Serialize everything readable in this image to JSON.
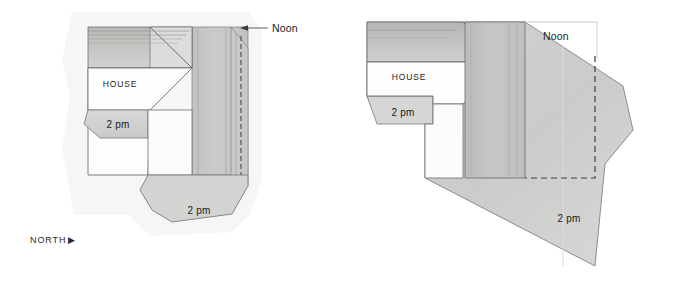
{
  "figure": {
    "type": "architectural-shadow-study",
    "panel_count": 2,
    "background_color": "#ffffff",
    "ink_color": "#555555"
  },
  "panels": [
    {
      "id": "left",
      "name": "shadow-plan-compact",
      "labels": {
        "house": "HOUSE",
        "noon": "Noon",
        "shadow_west": "2 pm",
        "shadow_south": "2 pm",
        "north": "NORTH",
        "north_arrow": "▶"
      },
      "colors": {
        "roof_fill": "#cdcdcb",
        "house_fill": "#fdfdfd",
        "shadow_noon_fill": "#c6c6c4",
        "shadow_2pm_fill": "#d4d4d2",
        "paper_fill": "#f3f3f1",
        "outline": "#6b6b6b",
        "dashed": "#4a4a4a"
      }
    },
    {
      "id": "right",
      "name": "shadow-plan-extended",
      "labels": {
        "house": "HOUSE",
        "noon": "Noon",
        "shadow_west": "2 pm",
        "shadow_south": "2 pm",
        "north": "NORTH",
        "north_arrow": "▶"
      },
      "colors": {
        "roof_fill": "#c9c9c7",
        "house_fill": "#fefefe",
        "shadow_noon_fill": "#c8c8c6",
        "shadow_2pm_fill": "#d6d6d4",
        "paper_fill": "#f4f4f2",
        "outline": "#6b6b6b",
        "dashed": "#3f3f3f"
      }
    }
  ]
}
